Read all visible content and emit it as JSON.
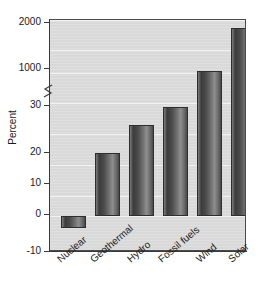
{
  "chart_data": {
    "type": "bar",
    "title": "",
    "xlabel": "",
    "ylabel": "Percent",
    "categories": [
      "Nuclear",
      "Geothermal",
      "Hydro",
      "Fossil fuels",
      "Wind",
      "Solar"
    ],
    "values": [
      -4,
      18,
      25,
      30,
      600,
      1700
    ],
    "axis_break": true,
    "axis_break_between": [
      30,
      1000
    ],
    "ytick_labels": [
      "2000",
      "1000",
      "30",
      "20",
      "10",
      "0",
      "-10"
    ],
    "ytick_values": [
      2000,
      1000,
      30,
      20,
      10,
      0,
      -10
    ],
    "ylim_lower_segment": [
      -10,
      30
    ],
    "ylim_upper_segment": [
      30,
      2000
    ],
    "grid": true,
    "legend": "none",
    "bar_color": "#5a5a5a",
    "background_color": "#dcdcdc"
  },
  "axis": {
    "y_title": "Percent",
    "ticks": [
      {
        "label": "2000",
        "top": 17
      },
      {
        "label": "1000",
        "top": 63
      },
      {
        "label": "30",
        "top": 100
      },
      {
        "label": "20",
        "top": 147
      },
      {
        "label": "10",
        "top": 178
      },
      {
        "label": "0",
        "top": 209
      },
      {
        "label": "-10",
        "top": 246
      }
    ]
  },
  "bars": [
    {
      "name": "Nuclear",
      "value": -4,
      "left": 11,
      "width": 25,
      "top": 215,
      "height": 12
    },
    {
      "name": "Geothermal",
      "value": 18,
      "left": 45,
      "width": 25,
      "top": 152,
      "height": 63
    },
    {
      "name": "Hydro",
      "value": 25,
      "left": 79,
      "width": 25,
      "top": 124,
      "height": 91
    },
    {
      "name": "Fossil fuels",
      "value": 30,
      "left": 113,
      "width": 25,
      "top": 106,
      "height": 109
    },
    {
      "name": "Wind",
      "value": 600,
      "left": 147,
      "width": 25,
      "top": 70,
      "height": 145
    },
    {
      "name": "Solar",
      "value": 1700,
      "left": 181,
      "width": 25,
      "top": 27,
      "height": 188
    }
  ],
  "x_labels": [
    {
      "label": "Nuclear",
      "left": 55
    },
    {
      "label": "Geothermal",
      "left": 88
    },
    {
      "label": "Hydro",
      "left": 125
    },
    {
      "label": "Fossil fuels",
      "left": 156
    },
    {
      "label": "Wind",
      "left": 194
    },
    {
      "label": "Solar",
      "left": 226
    }
  ],
  "gridlines": [
    {
      "top": 19
    },
    {
      "top": 49
    },
    {
      "top": 72
    },
    {
      "top": 102
    },
    {
      "top": 133
    },
    {
      "top": 164
    },
    {
      "top": 195
    },
    {
      "top": 215
    }
  ]
}
